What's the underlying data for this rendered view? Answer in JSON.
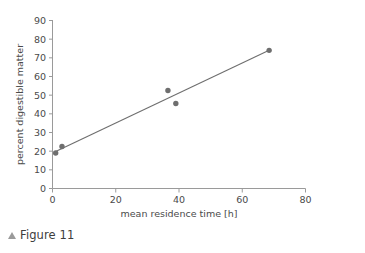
{
  "figure": {
    "caption": "Figure 11",
    "caption_marker": "triangle-up-icon"
  },
  "chart_data": {
    "type": "scatter",
    "title": "",
    "xlabel": "mean residence time [h]",
    "ylabel": "percent digestible matter",
    "xlim": [
      0,
      80
    ],
    "ylim": [
      0,
      90
    ],
    "xticks": [
      0,
      20,
      40,
      60,
      80
    ],
    "yticks": [
      0,
      10,
      20,
      30,
      40,
      50,
      60,
      70,
      80,
      90
    ],
    "xtick_labels": [
      "0",
      "20",
      "40",
      "60",
      "80"
    ],
    "ytick_labels": [
      "0",
      "10",
      "20",
      "30",
      "40",
      "50",
      "60",
      "70",
      "80",
      "90"
    ],
    "grid": false,
    "legend": null,
    "marker_color": "#6e6e6e",
    "line_color": "#6e6e6e",
    "axis_color": "#9a9a9a",
    "points": [
      {
        "x": 1.0,
        "y": 19.0
      },
      {
        "x": 3.0,
        "y": 22.5
      },
      {
        "x": 36.5,
        "y": 52.5
      },
      {
        "x": 39.0,
        "y": 45.5
      },
      {
        "x": 68.5,
        "y": 74.0
      }
    ],
    "series": [
      {
        "name": "digestible matter",
        "x": [
          1.0,
          3.0,
          36.5,
          39.0,
          68.5
        ],
        "values": [
          19.0,
          22.5,
          52.5,
          45.5,
          74.0
        ]
      }
    ],
    "trendline": {
      "type": "line",
      "x0": 1.0,
      "y0": 19.8,
      "x1": 68.5,
      "y1": 74.0
    }
  }
}
